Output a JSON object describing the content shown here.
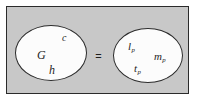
{
  "figure": {
    "kind": "equivalence-diagram",
    "relation": "=",
    "panel_color": "#c8c8c8",
    "border_color": "#2b2b2b",
    "ellipse_fill": "#fcfcfc",
    "text_color": "#1e1e1e"
  },
  "left_set": {
    "name": "fundamental-constants",
    "symbols": [
      {
        "id": "G",
        "base": "G",
        "sub": ""
      },
      {
        "id": "c",
        "base": "c",
        "sub": ""
      },
      {
        "id": "h",
        "base": "h",
        "sub": ""
      }
    ]
  },
  "right_set": {
    "name": "planck-units",
    "symbols": [
      {
        "id": "l_p",
        "base": "l",
        "sub": "p"
      },
      {
        "id": "m_p",
        "base": "m",
        "sub": "p"
      },
      {
        "id": "t_p",
        "base": "t",
        "sub": "p"
      }
    ]
  }
}
